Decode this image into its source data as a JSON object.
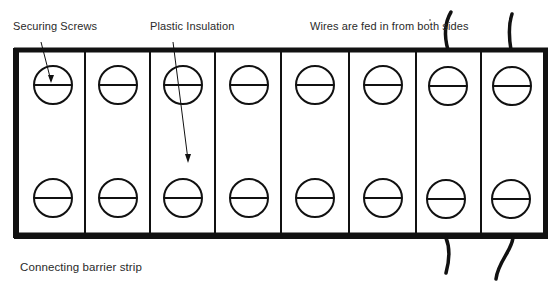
{
  "diagram": {
    "title": "Connecting barrier strip",
    "top_fragment": "",
    "labels": {
      "securing_screws": "Securing Screws",
      "plastic_insulation": "Plastic Insulation",
      "wires": "Wires are fed in from both sides"
    },
    "caption": "Connecting barrier strip",
    "strip": {
      "terminal_count": 8,
      "rows_of_screws": 2,
      "column_centers_x": [
        52,
        118,
        184,
        249,
        315,
        383,
        449,
        513
      ],
      "screw_rows_y": [
        85,
        198
      ],
      "screw_radius": 19,
      "outer_rect": {
        "x": 16,
        "y": 50,
        "width": 530,
        "height": 186
      },
      "dividers_x": [
        85,
        150,
        215,
        281,
        349,
        416,
        481
      ]
    },
    "wires": [
      {
        "side": "top",
        "terminal": 7
      },
      {
        "side": "top",
        "terminal": 8
      },
      {
        "side": "bottom",
        "terminal": 7
      },
      {
        "side": "bottom",
        "terminal": 8
      }
    ],
    "colors": {
      "ink": "#111111",
      "background": "#ffffff",
      "text": "#2a2a2a"
    }
  }
}
